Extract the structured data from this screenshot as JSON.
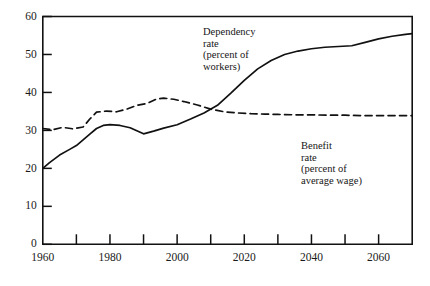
{
  "chart_data": {
    "type": "line",
    "title": "",
    "xlabel": "",
    "ylabel": "",
    "xlim": [
      1960,
      2070
    ],
    "ylim": [
      0,
      60
    ],
    "grid": false,
    "legend_position": "inline-annotations",
    "x_ticks": [
      1960,
      1970,
      1980,
      1990,
      2000,
      2010,
      2020,
      2030,
      2040,
      2050,
      2060,
      2070
    ],
    "x_tick_labels": [
      "1960",
      "",
      "1980",
      "",
      "2000",
      "",
      "2020",
      "",
      "2040",
      "",
      "2060",
      ""
    ],
    "y_ticks": [
      0,
      10,
      20,
      30,
      40,
      50,
      60
    ],
    "y_tick_labels": [
      "0",
      "10",
      "20",
      "30",
      "40",
      "50",
      "60"
    ],
    "series": [
      {
        "name": "Dependency rate (percent of workers)",
        "style": "solid",
        "color": "#111111",
        "x": [
          1960,
          1962,
          1965,
          1968,
          1970,
          1972,
          1974,
          1976,
          1978,
          1980,
          1983,
          1986,
          1990,
          1993,
          1996,
          2000,
          2004,
          2008,
          2012,
          2016,
          2020,
          2024,
          2028,
          2032,
          2036,
          2040,
          2044,
          2048,
          2052,
          2056,
          2060,
          2064,
          2068,
          2070
        ],
        "y": [
          20.0,
          21.5,
          23.5,
          25.0,
          26.0,
          27.5,
          29.0,
          30.5,
          31.3,
          31.5,
          31.3,
          30.7,
          29.1,
          29.8,
          30.6,
          31.5,
          33.0,
          34.6,
          36.6,
          39.8,
          43.2,
          46.2,
          48.4,
          50.0,
          50.9,
          51.5,
          51.9,
          52.1,
          52.3,
          53.2,
          54.1,
          54.8,
          55.3,
          55.5
        ]
      },
      {
        "name": "Benefit rate (percent of average wage)",
        "style": "dashed",
        "color": "#111111",
        "x": [
          1960,
          1963,
          1966,
          1969,
          1972,
          1974,
          1976,
          1979,
          1982,
          1985,
          1988,
          1991,
          1994,
          1996,
          1999,
          2002,
          2006,
          2010,
          2014,
          2018,
          2022,
          2026,
          2030,
          2035,
          2040,
          2045,
          2050,
          2055,
          2060,
          2065,
          2070
        ],
        "y": [
          30.5,
          30.2,
          30.8,
          30.4,
          30.9,
          33.0,
          34.8,
          35.1,
          34.9,
          35.6,
          36.6,
          37.1,
          38.3,
          38.5,
          38.2,
          37.6,
          36.7,
          35.6,
          34.9,
          34.6,
          34.4,
          34.3,
          34.2,
          34.1,
          34.1,
          34.0,
          34.0,
          33.9,
          33.9,
          33.9,
          33.9
        ]
      }
    ],
    "annotations": [
      {
        "id": "dependency",
        "lines": [
          "Dependency",
          "rate",
          "(percent of",
          "workers)"
        ]
      },
      {
        "id": "benefit",
        "lines": [
          "Benefit",
          "rate",
          "(percent of",
          "average wage)"
        ]
      }
    ]
  }
}
